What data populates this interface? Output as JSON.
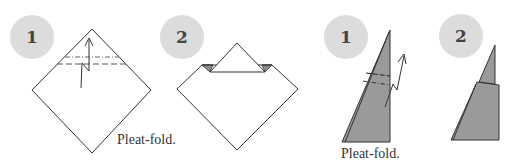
{
  "colors": {
    "badge_fill": "#dcdcdc",
    "badge_text": "#444444",
    "paper_white": "#ffffff",
    "paper_shaded": "#9a9a9a",
    "paper_shaded_dark": "#7a7a7a",
    "line": "#333333"
  },
  "sequences": [
    {
      "name": "square-base",
      "steps": [
        {
          "number": "1",
          "caption": "Pleat-fold.",
          "arrow": "pleat-arrow",
          "folds": [
            "mountain-fold-line",
            "valley-fold-line"
          ]
        },
        {
          "number": "2",
          "caption": ""
        }
      ]
    },
    {
      "name": "narrow-point",
      "steps": [
        {
          "number": "1",
          "caption": "Pleat-fold.",
          "arrow": "pleat-arrow",
          "folds": [
            "mountain-fold-line",
            "valley-fold-line"
          ]
        },
        {
          "number": "2",
          "caption": ""
        }
      ]
    }
  ]
}
